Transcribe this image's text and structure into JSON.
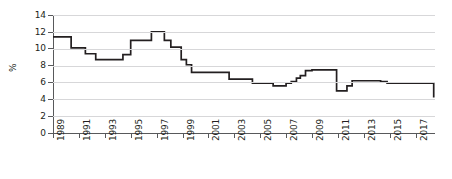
{
  "chart_data": {
    "type": "line",
    "title": "",
    "subtitle": "",
    "xlabel": "",
    "ylabel": "%",
    "ylim": [
      0,
      14
    ],
    "xlim": [
      1989,
      2018.5
    ],
    "ytick_labels": [
      "0",
      "2",
      "4",
      "6",
      "8",
      "10",
      "12",
      "14"
    ],
    "ytick_values": [
      0,
      2,
      4,
      6,
      8,
      10,
      12,
      14
    ],
    "xtick_labels": [
      "1989",
      "1991",
      "1993",
      "1995",
      "1997",
      "1999",
      "2001",
      "2003",
      "2005",
      "2007",
      "2009",
      "2011",
      "2013",
      "2015",
      "2017"
    ],
    "xtick_values": [
      1989,
      1991,
      1993,
      1995,
      1997,
      1999,
      2001,
      2003,
      2005,
      2007,
      2009,
      2011,
      2013,
      2015,
      2017
    ],
    "grid": "horizontal",
    "legend": "none",
    "line_style": "step",
    "line_color": "#231f20",
    "grid_color": "#d7d7d9",
    "axis_color": "#58595b",
    "series": [
      {
        "name": "rate",
        "x": [
          1989.0,
          1989.9,
          1990.4,
          1991.0,
          1991.5,
          1991.8,
          1992.3,
          1994.0,
          1994.4,
          1995.0,
          1995.6,
          1996.6,
          1997.1,
          1997.6,
          1998.1,
          1998.5,
          1998.9,
          1999.3,
          1999.7,
          2002.6,
          2004.4,
          2005.4,
          2006.0,
          2006.6,
          2007.0,
          2007.4,
          2007.8,
          2008.1,
          2008.5,
          2009.0,
          2009.3,
          2010.9,
          2011.3,
          2011.7,
          2012.1,
          2013.9,
          2014.3,
          2014.8,
          2018.4
        ],
        "y": [
          11.4,
          11.4,
          10.1,
          10.1,
          9.4,
          9.4,
          8.7,
          8.7,
          9.3,
          11.0,
          11.0,
          12.0,
          12.0,
          11.0,
          10.2,
          10.2,
          8.7,
          8.1,
          7.2,
          6.4,
          5.9,
          5.9,
          5.6,
          5.6,
          5.9,
          6.1,
          6.5,
          6.8,
          7.4,
          7.5,
          7.5,
          5.0,
          5.0,
          5.6,
          6.2,
          6.2,
          6.1,
          5.9,
          4.2
        ]
      }
    ]
  }
}
